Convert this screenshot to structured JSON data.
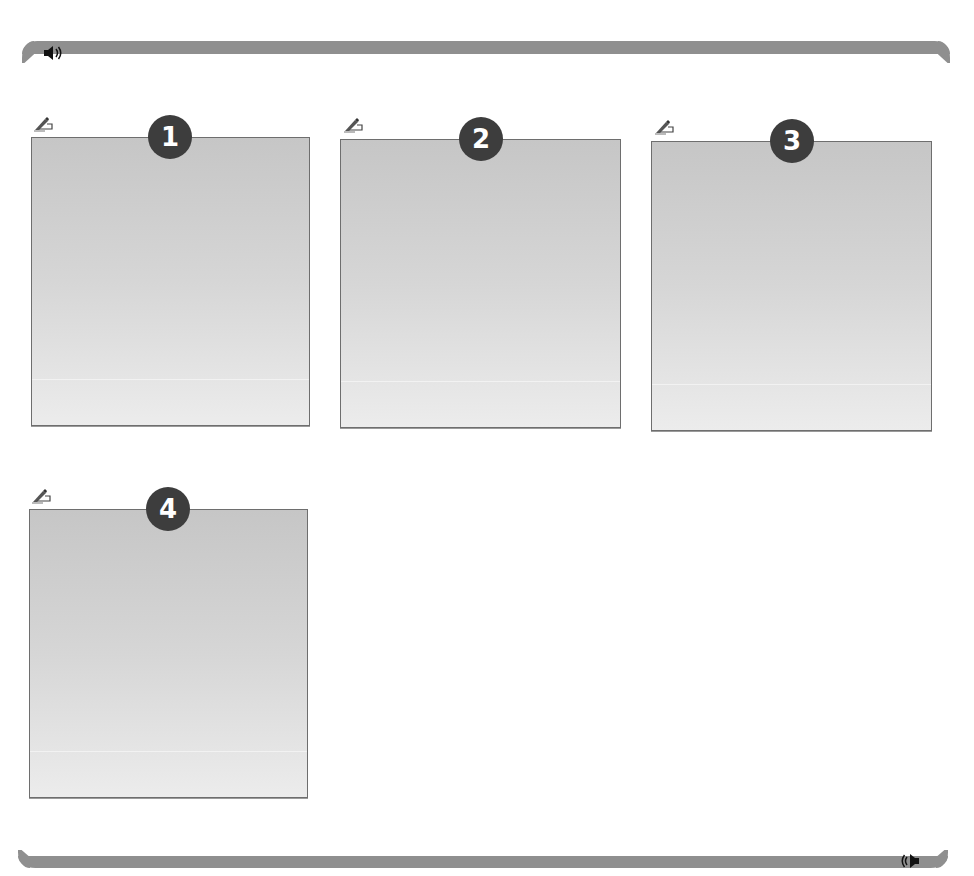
{
  "header": {
    "audio_icon": "speaker-icon"
  },
  "footer": {
    "audio_icon": "speaker-icon"
  },
  "cards": [
    {
      "number": "1",
      "edit_icon": "pencil-hand-icon"
    },
    {
      "number": "2",
      "edit_icon": "pencil-hand-icon"
    },
    {
      "number": "3",
      "edit_icon": "pencil-hand-icon"
    },
    {
      "number": "4",
      "edit_icon": "pencil-hand-icon"
    }
  ],
  "colors": {
    "bar": "#8f8f8f",
    "badge": "#3d3d3d",
    "panel_top": "#c6c6c6",
    "panel_bottom": "#ececec",
    "panel_border": "#6e6e6e"
  }
}
